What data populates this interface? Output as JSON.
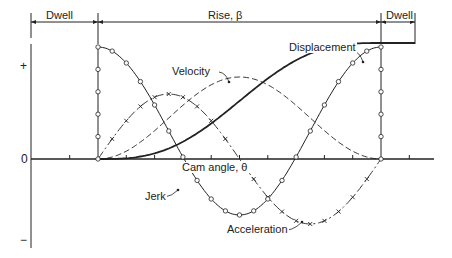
{
  "dimensions": {
    "left_dwell": "Dwell",
    "rise": "Rise, β",
    "right_dwell": "Dwell"
  },
  "axis": {
    "plus": "+",
    "zero": "0",
    "minus": "−",
    "x_label": "Cam angle, θ"
  },
  "curve_labels": {
    "displacement": "Displacement",
    "velocity": "Velocity",
    "jerk": "Jerk",
    "acceleration": "Acceleration"
  },
  "geometry": {
    "axis_y": 159,
    "axis_x": 31,
    "rise_start_x": 98,
    "rise_end_x": 381,
    "dwell_end_x": 415,
    "axis_end_x": 434,
    "displacement_top_y": 43,
    "tick_count": 10
  },
  "colors": {
    "ink": "#222222",
    "background": "#ffffff"
  }
}
